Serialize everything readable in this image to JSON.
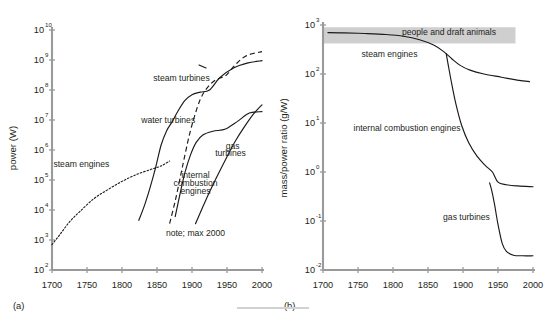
{
  "figure": {
    "panel_a_label": "(a)",
    "panel_b_label": "(b)"
  },
  "chart_data": [
    {
      "id": "a",
      "type": "line",
      "title": "",
      "xlabel": "",
      "ylabel": "power (W)",
      "xlim": [
        1700,
        2000
      ],
      "ylim": [
        100,
        10000000000
      ],
      "xscale": "linear",
      "yscale": "log",
      "grid": false,
      "legend": "inline-annotations",
      "xticks": [
        1700,
        1750,
        1800,
        1850,
        1900,
        1950,
        2000
      ],
      "xticklabels": [
        "1700",
        "1750",
        "1800",
        "1850",
        "1900",
        "1950",
        "2000"
      ],
      "yticks": [
        100,
        1000,
        10000,
        100000,
        1000000,
        10000000,
        100000000,
        1000000000,
        10000000000
      ],
      "yticklabels": [
        "10",
        "10",
        "10",
        "10",
        "10",
        "10",
        "10",
        "10",
        "10"
      ],
      "ytickexponents": [
        "2",
        "3",
        "4",
        "5",
        "6",
        "7",
        "8",
        "9",
        "10"
      ],
      "annotations": [
        {
          "text": "steam turbines",
          "x": 1885,
          "y": 200000000
        },
        {
          "text": "water turbines",
          "x": 1866,
          "y": 8000000
        },
        {
          "text": "steam engines",
          "x": 1742,
          "y": 280000
        },
        {
          "text": "gas",
          "x": 1958,
          "y": 1100000
        },
        {
          "text": "turbines",
          "x": 1955,
          "y": 620000
        },
        {
          "text": "internal",
          "x": 1905,
          "y": 120000
        },
        {
          "text": "combustion",
          "x": 1905,
          "y": 62000
        },
        {
          "text": "engines",
          "x": 1905,
          "y": 33000
        },
        {
          "text": "note;  max 2000",
          "x": 1905,
          "y": 1350
        }
      ],
      "series": [
        {
          "name": "steam engines",
          "style": "dotted",
          "x": [
            1700,
            1712,
            1725,
            1740,
            1760,
            1780,
            1800,
            1820,
            1840,
            1852,
            1860,
            1868
          ],
          "values": [
            700,
            1600,
            4000,
            9000,
            24000,
            48000,
            90000,
            150000,
            220000,
            270000,
            330000,
            430000
          ]
        },
        {
          "name": "water turbines",
          "style": "solid",
          "x": [
            1824,
            1832,
            1840,
            1848,
            1856,
            1864,
            1872,
            1880,
            1890,
            1900,
            1912,
            1925,
            1940,
            1960,
            1980,
            2000
          ],
          "values": [
            4500,
            14000,
            55000,
            260000,
            1500000,
            4500000,
            9000000,
            20000000.0,
            45000000.0,
            70000000.0,
            85000000.0,
            100000000.0,
            260000000.0,
            550000000.0,
            800000000.0,
            950000000.0
          ]
        },
        {
          "name": "steam turbines",
          "style": "dashed",
          "x": [
            1868,
            1876,
            1884,
            1890,
            1896,
            1903,
            1912,
            1922,
            1934,
            1948,
            1962,
            1978,
            2000
          ],
          "values": [
            3500,
            20000,
            150000,
            700000,
            3000000,
            12000000.0,
            50000000.0,
            120000000.0,
            220000000.0,
            300000000.0,
            700000000.0,
            1400000000.0,
            1900000000.0
          ]
        },
        {
          "name": "internal combustion engines",
          "style": "solid",
          "x": [
            1876,
            1884,
            1890,
            1898,
            1906,
            1916,
            1930,
            1948,
            1965,
            1982,
            2000
          ],
          "values": [
            6000,
            45000,
            180000,
            700000,
            1800000,
            3200000,
            4200000,
            5000000,
            9000000,
            17000000.0,
            19000000.0
          ]
        },
        {
          "name": "gas turbines",
          "style": "solid",
          "x": [
            1905,
            1920,
            1935,
            1950,
            1962,
            1975,
            1988,
            2000
          ],
          "values": [
            3500,
            22000,
            120000,
            600000,
            2000000,
            6000000,
            16000000.0,
            32000000.0
          ]
        }
      ]
    },
    {
      "id": "b",
      "type": "line",
      "title": "",
      "xlabel": "",
      "ylabel": "mass/power ratio (g/W)",
      "xlim": [
        1700,
        2000
      ],
      "ylim": [
        0.01,
        1000
      ],
      "xscale": "linear",
      "yscale": "log",
      "grid": false,
      "legend": "inline-annotations",
      "xticks": [
        1700,
        1750,
        1800,
        1850,
        1900,
        1950,
        2000
      ],
      "xticklabels": [
        "1700",
        "1750",
        "1800",
        "1850",
        "1900",
        "1950",
        "2000"
      ],
      "yticks": [
        0.01,
        0.1,
        1,
        10,
        100,
        1000
      ],
      "yticklabels": [
        "10",
        "10",
        "10",
        "10",
        "10",
        "10"
      ],
      "ytickexponents": [
        "-2",
        "-1",
        "0",
        "1",
        "2",
        "3"
      ],
      "annotations": [
        {
          "text": "people and draft animals",
          "x": 1880,
          "y": 620
        },
        {
          "text": "steam engines",
          "x": 1795,
          "y": 220
        },
        {
          "text": "internal combustion engines",
          "x": 1820,
          "y": 7.0
        },
        {
          "text": "gas turbines",
          "x": 1905,
          "y": 0.105
        }
      ],
      "bands": [
        {
          "name": "people and draft animals",
          "y_low": 420,
          "y_high": 900,
          "x_start": 1700,
          "x_end": 1975,
          "color": "#cfcfcf"
        }
      ],
      "series": [
        {
          "name": "steam engines",
          "style": "solid",
          "x": [
            1707,
            1730,
            1760,
            1790,
            1815,
            1838,
            1858,
            1872,
            1884,
            1896,
            1910,
            1930,
            1955,
            1980,
            1995
          ],
          "values": [
            700,
            690,
            670,
            640,
            590,
            500,
            390,
            290,
            205,
            150,
            120,
            100,
            86,
            74,
            70
          ]
        },
        {
          "name": "internal combustion engines",
          "style": "solid",
          "x": [
            1876,
            1879,
            1884,
            1890,
            1898,
            1908,
            1920,
            1932,
            1942,
            1950,
            1962,
            1978,
            2000
          ],
          "values": [
            260,
            150,
            62,
            24,
            9.0,
            4.0,
            2.1,
            1.35,
            1.0,
            0.62,
            0.55,
            0.52,
            0.5
          ]
        },
        {
          "name": "gas turbines",
          "style": "solid",
          "x": [
            1938,
            1941,
            1945,
            1950,
            1956,
            1962,
            1972,
            1985,
            2000
          ],
          "values": [
            0.6,
            0.42,
            0.22,
            0.085,
            0.035,
            0.024,
            0.02,
            0.0195,
            0.0195
          ]
        }
      ]
    }
  ]
}
